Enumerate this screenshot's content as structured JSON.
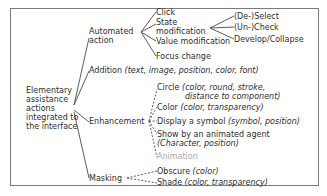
{
  "diagram": {
    "root": {
      "lines": [
        "Elementary",
        "assistance",
        "actions",
        "integrated to",
        "the interface"
      ]
    },
    "branches": {
      "automated": {
        "label_lines": [
          "Automated",
          "action"
        ],
        "children": {
          "click": "Click",
          "state_lines": [
            "State",
            "modification"
          ],
          "value": "Value modification",
          "focus": "Focus change"
        },
        "state_children": {
          "select": "(De-)Select",
          "check": "(Un-)Check",
          "develop": "Develop/Collapse"
        }
      },
      "addition": {
        "label": "Addition",
        "params": "(text, image, position, color, font)"
      },
      "enhancement": {
        "label": "Enhancement",
        "children": {
          "circle": {
            "label": "Circle",
            "params_1": "(color, round, stroke,",
            "params_2": "distance to component)"
          },
          "color": {
            "label": "Color",
            "params": "(color, transparency)"
          },
          "symbol": {
            "label": "Display a symbol",
            "params": "(symbol, position)"
          },
          "agent": {
            "label": "Show by an animated agent",
            "params": "(Character, position)"
          },
          "animation": {
            "label": "Animation"
          }
        }
      },
      "masking": {
        "label": "Masking",
        "children": {
          "obscure": {
            "label": "Obscure",
            "params": "(color)"
          },
          "shade": {
            "label": "Shade",
            "params": "(color, transparency)"
          }
        }
      }
    },
    "colors": {
      "line": "#4a4a4a",
      "text": "#2e2e2e",
      "disabled_text": "#a8a8a8",
      "frame": "#7a7a7a"
    }
  }
}
